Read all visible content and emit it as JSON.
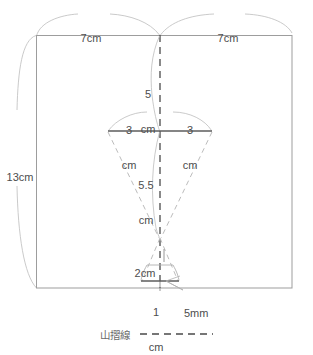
{
  "diagram": {
    "title": "",
    "colors": {
      "outline": "#9a9a9a",
      "arc": "#b5b5b5",
      "dashed_fold": "#4a4a4a",
      "dashed_guide": "#b9b9b9",
      "solid_bar": "#5a5a5a",
      "text": "#4d4d4d",
      "background": "#ffffff"
    },
    "measurements": [
      {
        "id": "top-left-width",
        "value": "7cm",
        "lines": [
          "7cm"
        ],
        "x": 87,
        "y": 16
      },
      {
        "id": "top-right-width",
        "value": "7cm",
        "lines": [
          "7cm"
        ],
        "x": 228,
        "y": 16
      },
      {
        "id": "left-height",
        "value": "13cm",
        "lines": [
          "13cm"
        ],
        "x": 18,
        "y": 155
      },
      {
        "id": "center-top-drop",
        "value": "5 cm",
        "lines": [
          "5",
          "cm"
        ],
        "x": 148,
        "y": 72
      },
      {
        "id": "bar-left-half",
        "value": "3 cm",
        "lines": [
          "3",
          "cm"
        ],
        "x": 129,
        "y": 108
      },
      {
        "id": "bar-right-half",
        "value": "3 cm",
        "lines": [
          "3",
          "cm"
        ],
        "x": 190,
        "y": 108
      },
      {
        "id": "mid-drop",
        "value": "5.5 cm",
        "lines": [
          "5.5",
          "cm"
        ],
        "x": 147,
        "y": 163
      },
      {
        "id": "lower-height",
        "value": "2cm",
        "lines": [
          "2cm"
        ],
        "x": 145,
        "y": 250
      },
      {
        "id": "bottom-small-width",
        "value": "1 cm",
        "lines": [
          "1",
          "cm"
        ],
        "x": 156,
        "y": 287
      },
      {
        "id": "bottom-offset",
        "value": "5mm",
        "lines": [
          "5mm"
        ],
        "x": 186,
        "y": 288
      }
    ],
    "legend": {
      "label": "山摺線",
      "line_style": "dashed",
      "label_x": 100,
      "label_y": 329,
      "line_x1": 140,
      "line_x2": 213,
      "line_y": 334
    },
    "geometry": {
      "sheet": {
        "left": 36,
        "top": 35,
        "right": 292,
        "bottom": 288
      },
      "center_x": 160,
      "center_bar": {
        "x1": 108,
        "x2": 212,
        "y": 131
      },
      "small_bar": {
        "x1": 141,
        "x2": 179,
        "y": 281
      },
      "converge_point": {
        "x": 160,
        "y": 238
      }
    }
  }
}
